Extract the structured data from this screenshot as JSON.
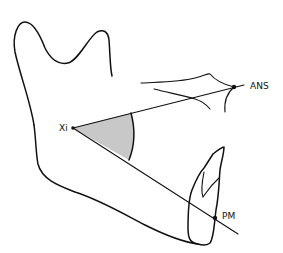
{
  "diagram": {
    "type": "cephalometric-mandible-angle",
    "labels": {
      "xi": "Xi",
      "ans": "ANS",
      "pm": "PM"
    },
    "points": {
      "xi": [
        73,
        128
      ],
      "ans": [
        234,
        87
      ],
      "pm": [
        215,
        218
      ]
    },
    "colors": {
      "line": "#111111",
      "angle_fill": "#c8c8c8",
      "background": "#ffffff"
    }
  }
}
